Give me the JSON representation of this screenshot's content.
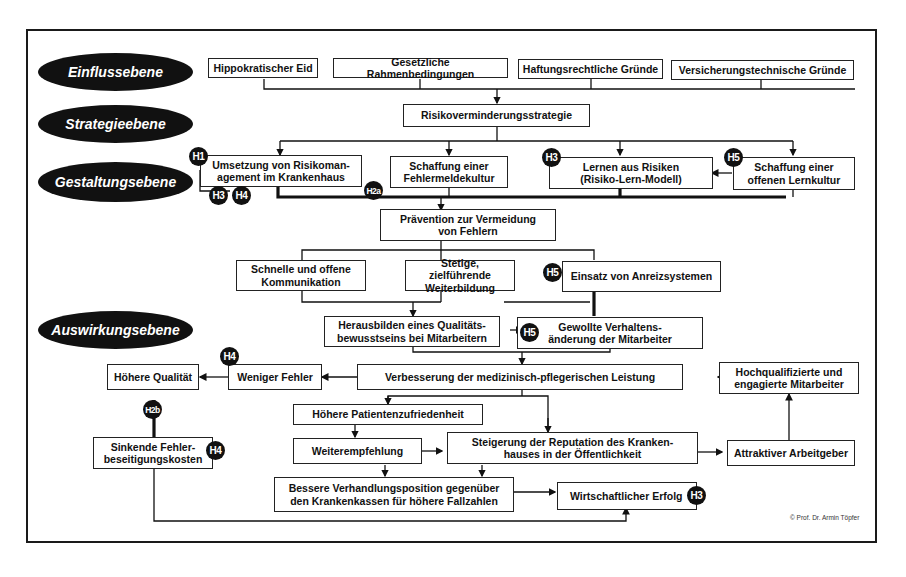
{
  "levels": [
    {
      "label": "Einflussebene"
    },
    {
      "label": "Strategieebene"
    },
    {
      "label": "Gestaltungsebene"
    },
    {
      "label": "Auswirkungsebene"
    }
  ],
  "influence": [
    {
      "label": "Hippokratischer Eid"
    },
    {
      "label": "Gesetzliche Rahmenbedingungen"
    },
    {
      "label": "Haftungsrechtliche Gründe"
    },
    {
      "label": "Versicherungstechnische Gründe"
    }
  ],
  "strategy": {
    "label": "Risikoverminderungsstrategie"
  },
  "design": [
    {
      "label": "Umsetzung von Risikoman-\nagement im Krankenhaus"
    },
    {
      "label": "Schaffung einer\nFehlermeldekultur"
    },
    {
      "label": "Lernen aus Risiken\n(Risiko-Lern-Modell)"
    },
    {
      "label": "Schaffung einer\noffenen Lernkultur"
    }
  ],
  "prevention": {
    "label": "Prävention zur Vermeidung\nvon Fehlern"
  },
  "measures": [
    {
      "label": "Schnelle und offene\nKommunikation"
    },
    {
      "label": "Stetige, zielführende\nWeiterbildung"
    },
    {
      "label": "Einsatz von Anreizsystemen"
    }
  ],
  "effects": {
    "quality_awareness": "Herausbilden eines Qualitäts-\nbewusstseins bei Mitarbeitern",
    "behavior_change": "Gewollte Verhaltens-\nänderung der Mitarbeiter",
    "improvement": "Verbesserung der medizinisch-pflegerischen Leistung",
    "fewer_errors": "Weniger Fehler",
    "higher_quality": "Höhere Qualität",
    "qualified_staff": "Hochqualifizierte und\nengagierte Mitarbeiter",
    "patient_satisfaction": "Höhere Patientenzufriedenheit",
    "recommendation": "Weiterempfehlung",
    "reputation": "Steigerung der Reputation des Kranken-\nhauses in der Öffentlichkeit",
    "attractive_employer": "Attraktiver Arbeitgeber",
    "lower_costs": "Sinkende Fehler-\nbeseitigungskosten",
    "negotiation": "Bessere Verhandlungsposition gegenüber\nden Krankenkassen für höhere Fallzahlen",
    "economic_success": "Wirtschaftlicher Erfolg"
  },
  "badges": {
    "h1": "H1",
    "h2a": "H2a",
    "h2b": "H2b",
    "h3": "H3",
    "h4": "H4",
    "h5": "H5"
  },
  "copyright": "© Prof. Dr. Armin Töpfer"
}
